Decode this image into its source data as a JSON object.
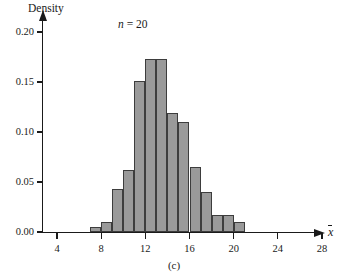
{
  "figure": {
    "panel_label": "(c)",
    "annotation": {
      "symbol": "n",
      "equals": "=",
      "value": "20"
    }
  },
  "chart_data": {
    "type": "bar",
    "title": "",
    "subtitle": "",
    "ylabel": "Density",
    "xlabel": "x̄",
    "annotations": [
      "n = 20"
    ],
    "panel": "(c)",
    "grid": false,
    "legend": null,
    "bin_width": 1,
    "xlim": [
      2,
      30
    ],
    "ylim": [
      0.0,
      0.215
    ],
    "xticks": [
      4,
      8,
      12,
      16,
      20,
      24,
      28
    ],
    "xtick_labels": [
      "4",
      "8",
      "12",
      "16",
      "20",
      "24",
      "28"
    ],
    "yticks": [
      0.0,
      0.05,
      0.1,
      0.15,
      0.2
    ],
    "ytick_labels": [
      "0.00",
      "0.05",
      "0.10",
      "0.15",
      "0.20"
    ],
    "bin_edges": [
      7,
      8,
      9,
      10,
      11,
      12,
      13,
      14,
      15,
      16,
      17,
      18,
      19,
      20,
      21
    ],
    "categories": [
      "7-8",
      "8-9",
      "9-10",
      "10-11",
      "11-12",
      "12-13",
      "13-14",
      "14-15",
      "15-16",
      "16-17",
      "17-18",
      "18-19",
      "19-20",
      "20-21"
    ],
    "values": [
      0.005,
      0.01,
      0.043,
      0.062,
      0.151,
      0.173,
      0.173,
      0.119,
      0.11,
      0.065,
      0.04,
      0.017,
      0.017,
      0.01
    ],
    "bar_color": "#9a9a9a",
    "bar_edge_color": "#3d3d3d"
  }
}
